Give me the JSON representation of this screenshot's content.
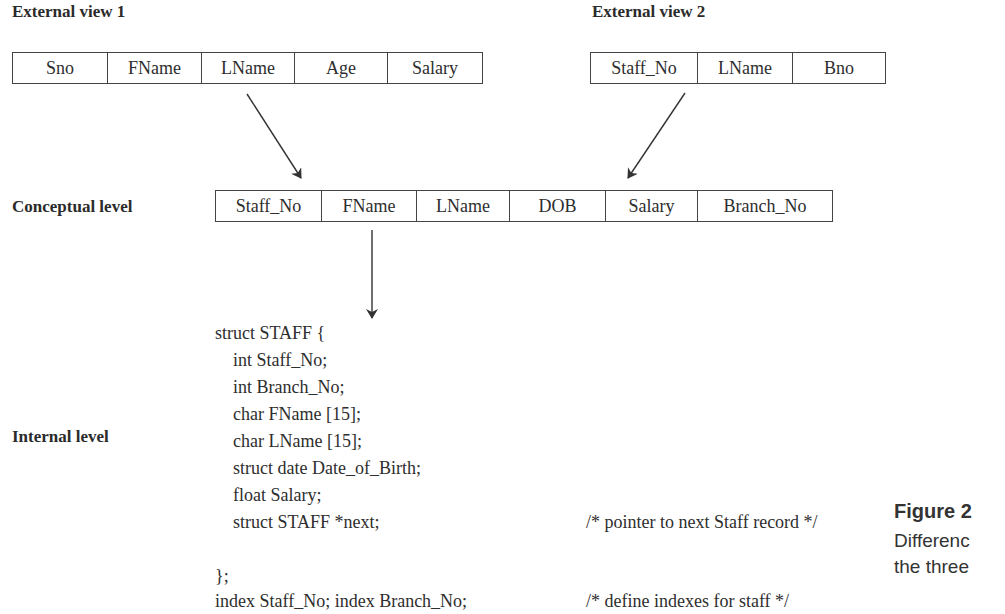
{
  "headings": {
    "external_view_1": "External view 1",
    "external_view_2": "External view 2",
    "conceptual_level": "Conceptual level",
    "internal_level": "Internal level"
  },
  "external_view_1": {
    "fields": [
      "Sno",
      "FName",
      "LName",
      "Age",
      "Salary"
    ]
  },
  "external_view_2": {
    "fields": [
      "Staff_No",
      "LName",
      "Bno"
    ]
  },
  "conceptual_view": {
    "fields": [
      "Staff_No",
      "FName",
      "LName",
      "DOB",
      "Salary",
      "Branch_No"
    ]
  },
  "internal_code": {
    "lines": [
      "struct STAFF {",
      "    int Staff_No;",
      "    int Branch_No;",
      "    char FName [15];",
      "    char LName [15];",
      "    struct date Date_of_Birth;",
      "    float Salary;",
      "    struct STAFF *next;",
      "",
      "};",
      "index Staff_No; index Branch_No;"
    ],
    "comments": {
      "next_pointer": "/* pointer to next Staff record */",
      "indexes": "/* define indexes for staff */"
    }
  },
  "figure": {
    "title": "Figure 2",
    "caption_line1": "Differenc",
    "caption_line2": "the three"
  },
  "colors": {
    "text": "#2e2e2e",
    "border": "#444444",
    "arrow": "#333333"
  }
}
